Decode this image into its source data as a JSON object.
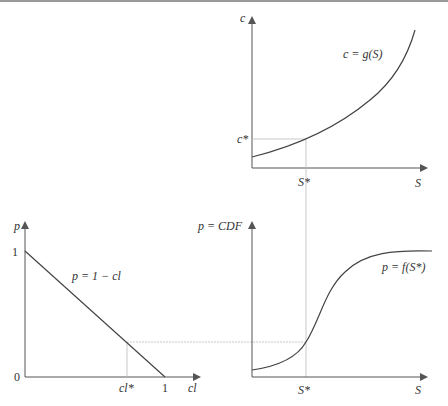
{
  "colors": {
    "axis": "#555555",
    "curve": "#444444",
    "guide": "#bbbbbb"
  },
  "top_chart": {
    "y_axis_label": "c",
    "x_axis_label": "S",
    "curve_label": "c = g(S)",
    "y_marker_label": "c*",
    "x_marker_label": "S*"
  },
  "bottom_left_chart": {
    "y_axis_label": "p",
    "x_axis_label": "cl",
    "curve_label": "p = 1 − cl",
    "y_tick_top": "1",
    "y_tick_origin": "0",
    "x_tick_end": "1",
    "x_marker_label": "cl*"
  },
  "bottom_right_chart": {
    "y_axis_label": "p = CDF",
    "x_axis_label": "S",
    "curve_label": "p = f(S*)",
    "x_marker_label": "S*"
  }
}
